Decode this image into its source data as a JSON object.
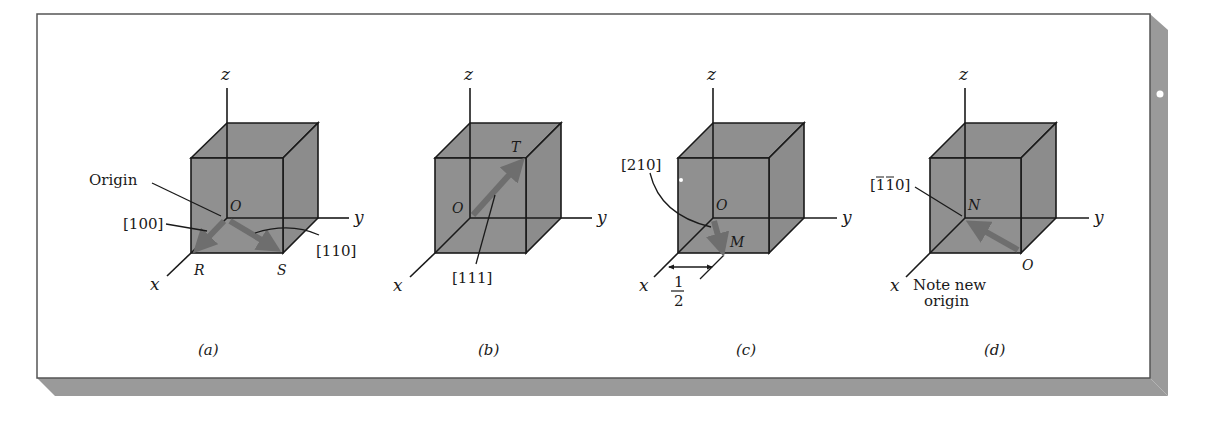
{
  "figure": {
    "colors": {
      "cube_fill": "#8f8f8f",
      "edge": "#1a1a1a",
      "arrow": "#6e6e6e",
      "panel_shadow": "#9a9a9a",
      "panel_border": "#555555",
      "background": "#ffffff"
    },
    "panels": [
      {
        "id": "a",
        "caption": "(a)",
        "axes": {
          "x": "x",
          "y": "y",
          "z": "z"
        },
        "points": {
          "origin": "O",
          "R": "R",
          "S": "S"
        },
        "callouts": {
          "origin": "Origin",
          "dir1": "[100]",
          "dir2": "[110]"
        }
      },
      {
        "id": "b",
        "caption": "(b)",
        "axes": {
          "x": "x",
          "y": "y",
          "z": "z"
        },
        "points": {
          "origin": "O",
          "T": "T"
        },
        "callouts": {
          "dir": "[111]"
        }
      },
      {
        "id": "c",
        "caption": "(c)",
        "axes": {
          "x": "x",
          "y": "y",
          "z": "z"
        },
        "points": {
          "origin": "O",
          "M": "M"
        },
        "callouts": {
          "dir": "[210]",
          "half_num": "1",
          "half_den": "2"
        }
      },
      {
        "id": "d",
        "caption": "(d)",
        "axes": {
          "x": "x",
          "y": "y",
          "z": "z"
        },
        "points": {
          "N": "N",
          "origin": "O"
        },
        "callouts": {
          "dir_prefix": "[",
          "dir_bar1": "1",
          "dir_bar2": "1",
          "dir_suffix": "0]",
          "note_line1": "Note new",
          "note_line2": "origin"
        }
      }
    ]
  }
}
